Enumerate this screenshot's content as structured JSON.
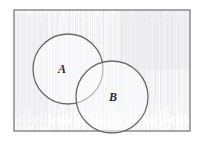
{
  "figure": {
    "width": 202,
    "height": 141,
    "background_color": "#ffffff"
  },
  "universe": {
    "name": "universal-set-rectangle",
    "x": 14,
    "y": 10,
    "width": 176,
    "height": 121,
    "stroke_color": "#83838b",
    "stroke_width": 1.4,
    "fill_color": "#fbfbfc"
  },
  "shading": {
    "name": "pencil-hatch-texture",
    "color": "#d9d9de",
    "opacity": 0.55,
    "description": "light vertical pencil streaks filling the rectangle"
  },
  "circles": [
    {
      "id": "circle-a",
      "label": "A",
      "cx": 68,
      "cy": 69,
      "r": 35,
      "stroke_color": "#6a6a72",
      "stroke_width": 1.3,
      "fill_color": "#fcfcfd",
      "label_x": 62,
      "label_y": 70
    },
    {
      "id": "circle-b",
      "label": "B",
      "cx": 112,
      "cy": 97,
      "r": 36,
      "stroke_color": "#6a6a72",
      "stroke_width": 1.3,
      "fill_color": "#fcfcfd",
      "label_x": 113,
      "label_y": 98
    }
  ],
  "labels": {
    "set_a": "A",
    "set_b": "B"
  }
}
